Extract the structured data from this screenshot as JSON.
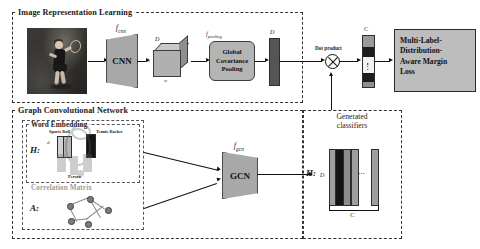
{
  "figure": {
    "sections": {
      "image_branch": {
        "title": "Image Representation Learning"
      },
      "gcn_branch": {
        "title": "Graph Convolutional Network"
      },
      "word_embedding": {
        "title": "Word Embedding"
      },
      "correlation_matrix": {
        "title": "Correlation Matrix"
      },
      "generated_classifiers": {
        "title_line1": "Generated",
        "title_line2": "classifiers"
      }
    },
    "image_branch": {
      "photo_alt": "tennis-player-photo",
      "cnn": {
        "label": "CNN",
        "fn_label": "f",
        "fn_sub": "cnn"
      },
      "feature_cube": {
        "depth_label": "D",
        "height_label": "h",
        "width_label": "w"
      },
      "pooling": {
        "fn_label": "f",
        "fn_sub": "pooling",
        "line1": "Global",
        "line2": "Covariance",
        "line3": "Pooling"
      },
      "feature_vector": {
        "label": "D"
      }
    },
    "gcn_branch": {
      "word_embedding": {
        "matrix_label": "H:",
        "dim_label": "d",
        "labels": [
          "Sports Ball",
          "Tennis Racket",
          "Person"
        ]
      },
      "correlation_matrix": {
        "matrix_label": "A:"
      },
      "gcn": {
        "label": "GCN",
        "fn_label": "f",
        "fn_sub": "gcn"
      },
      "classifiers": {
        "matrix_label": "H:",
        "row_dim_label": "D",
        "col_dim_label": "C",
        "ellipsis": "⋯"
      }
    },
    "fusion": {
      "operator_label": "Dot product",
      "operator_symbol": "⊗",
      "score_vector": {
        "label": "C"
      }
    },
    "loss": {
      "line1": "Multi-Label-",
      "line2": "Distribution-",
      "line3": "Aware Margin",
      "line4": "Loss"
    },
    "colors": {
      "ink": "#111111",
      "block_fill": "#a8a8a8",
      "pool_fill": "#b4b4b4",
      "loss_fill": "#bdbdbd",
      "bar_dark": "#4a4a4a",
      "bar_light": "#9e9e9e",
      "photo_bg": "#2b2b2b",
      "dash_border": "#333333"
    }
  }
}
